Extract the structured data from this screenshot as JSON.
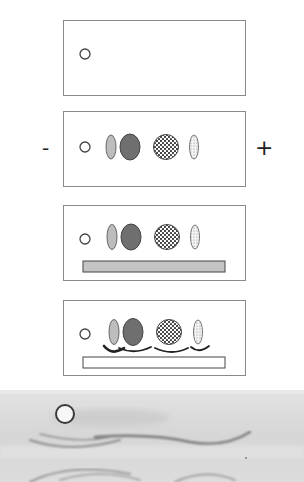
{
  "diagram": {
    "type": "immunoelectrophoresis-schematic",
    "electrodes": {
      "negative_label": "-",
      "positive_label": "+"
    },
    "panels": [
      {
        "step": 1,
        "contents": [
          "sample-well"
        ]
      },
      {
        "step": 2,
        "contents": [
          "sample-well",
          "separated-proteins"
        ]
      },
      {
        "step": 3,
        "contents": [
          "sample-well",
          "separated-proteins",
          "antiserum-trough-filled"
        ]
      },
      {
        "step": 4,
        "contents": [
          "sample-well",
          "separated-proteins",
          "precipitin-arcs",
          "antiserum-trough"
        ]
      }
    ],
    "protein_bands": [
      {
        "name": "light-oval",
        "fill": "#bdbdbd",
        "pattern": "stipple-light"
      },
      {
        "name": "dark-oval",
        "fill": "#6f6f6f",
        "pattern": "stipple-dark"
      },
      {
        "name": "dotted-circle",
        "fill": "#ffffff",
        "pattern": "dots-dark"
      },
      {
        "name": "hatched-small-oval",
        "fill": "#f2f2f2",
        "pattern": "dots-light"
      }
    ],
    "colors": {
      "outline": "#555555",
      "panel_border": "#8a8a8a",
      "trough_fill": "#c4c4c4",
      "photo_bg": "#d9d9d9",
      "arc": "#333333"
    },
    "photo": {
      "description": "gel photograph with sample well and precipitin arcs"
    }
  }
}
